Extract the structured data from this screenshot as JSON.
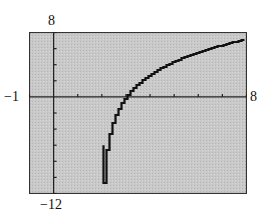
{
  "window": {
    "xmin": "-1",
    "xmax": "8",
    "ymin": "-12",
    "ymax": "8"
  },
  "colors": {
    "background": "#c8c8c8",
    "curve": "#111111",
    "axis": "#222222",
    "frame": "#333333"
  },
  "chart_data": {
    "type": "line",
    "title": "",
    "xlabel": "",
    "ylabel": "",
    "xlim": [
      -1,
      8
    ],
    "ylim": [
      -12,
      8
    ],
    "xscale_tick": 1,
    "yscale_tick": 2,
    "grid": false,
    "legend": null,
    "window_labels": {
      "left": "-1",
      "right": "8",
      "top": "8",
      "bottom": "-12"
    },
    "series": [
      {
        "name": "y = 4 ln(x - 2) (approx.)",
        "x": [
          2.07,
          2.1,
          2.2,
          2.3,
          2.5,
          2.75,
          3,
          3.5,
          4,
          4.5,
          5,
          5.5,
          6,
          6.5,
          7,
          7.5,
          8
        ],
        "y": [
          -10.6,
          -9.2,
          -6.4,
          -4.8,
          -2.8,
          -1.2,
          0,
          1.6,
          2.8,
          3.7,
          4.4,
          5.0,
          5.5,
          6.0,
          6.4,
          6.8,
          7.2
        ]
      }
    ],
    "annotations": [
      "vertical asymptote near x = 2",
      "x-intercept at x = 3"
    ]
  }
}
